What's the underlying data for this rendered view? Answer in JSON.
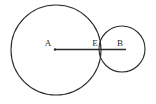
{
  "figure": {
    "type": "geometry-diagram",
    "background_color": "#ffffff",
    "stroke_color": "#2b2b2b",
    "label_color": "#2b2b2b",
    "canvas": {
      "width": 156,
      "height": 104
    },
    "circles": [
      {
        "id": "circle-a",
        "center_label": "A",
        "cx": 56,
        "cy": 50,
        "r": 45,
        "stroke_width": 1.1,
        "fill": "none"
      },
      {
        "id": "circle-b",
        "center_label": "B",
        "cx": 122,
        "cy": 49,
        "r": 23,
        "stroke_width": 1.1,
        "fill": "none"
      }
    ],
    "segment": {
      "id": "segment-ab",
      "from_label": "A",
      "to_label": "B",
      "x1": 55,
      "y1": 49.5,
      "x2": 126,
      "y2": 49.5,
      "stroke_width": 1.6
    },
    "points": [
      {
        "label": "A",
        "x": 55,
        "y": 49.5,
        "label_x": 48,
        "label_y": 46,
        "marker": true
      },
      {
        "label": "E",
        "x": 101,
        "y": 49.5,
        "label_x": 95,
        "label_y": 46,
        "marker": false
      },
      {
        "label": "B",
        "x": 122,
        "y": 49.5,
        "label_x": 120,
        "label_y": 46,
        "marker": false
      }
    ],
    "labels": {
      "a": "A",
      "e": "E",
      "b": "B"
    }
  }
}
